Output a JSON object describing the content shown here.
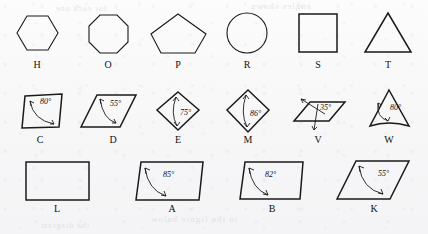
{
  "figure": {
    "background_color": "#f8f8f8",
    "ink_color": "#1a1a1a",
    "ghost_texts": [
      {
        "text": "in the figure below",
        "x": 150,
        "y": 222,
        "size": 9
      },
      {
        "text": "the diagram",
        "x": 40,
        "y": 228,
        "size": 8
      },
      {
        "text": "angles shown",
        "x": 260,
        "y": 8,
        "size": 9
      },
      {
        "text": "for each one",
        "x": 60,
        "y": 12,
        "size": 8
      }
    ],
    "rows": [
      {
        "row_id": "row-polygons",
        "label_y": 68,
        "items": [
          {
            "id": "H",
            "label": "H",
            "shape": "hexagon",
            "label_x": 37,
            "angle": null
          },
          {
            "id": "O",
            "label": "O",
            "shape": "octagon",
            "label_x": 108,
            "angle": null
          },
          {
            "id": "P",
            "label": "P",
            "shape": "pentagon",
            "label_x": 178,
            "angle": null
          },
          {
            "id": "R",
            "label": "R",
            "shape": "circle",
            "label_x": 247,
            "angle": null
          },
          {
            "id": "S",
            "label": "S",
            "shape": "square",
            "label_x": 318,
            "angle": null
          },
          {
            "id": "T",
            "label": "T",
            "shape": "triangle",
            "label_x": 388,
            "angle": null
          }
        ]
      },
      {
        "row_id": "row-angled-small",
        "label_y": 143,
        "items": [
          {
            "id": "C",
            "label": "C",
            "shape": "parallelogram-slanted",
            "label_x": 40,
            "angle": "80°"
          },
          {
            "id": "D",
            "label": "D",
            "shape": "rhombus-wide",
            "label_x": 113,
            "angle": "55°"
          },
          {
            "id": "E",
            "label": "E",
            "shape": "diamond",
            "label_x": 178,
            "angle": "75°"
          },
          {
            "id": "M",
            "label": "M",
            "shape": "diamond-tall",
            "label_x": 248,
            "angle": "86°"
          },
          {
            "id": "V",
            "label": "V",
            "shape": "parallelogram-flat",
            "label_x": 318,
            "angle": "35°"
          },
          {
            "id": "W",
            "label": "W",
            "shape": "trapezoid-curved",
            "label_x": 389,
            "angle": "80°"
          }
        ]
      },
      {
        "row_id": "row-quads",
        "label_y": 212,
        "items": [
          {
            "id": "L",
            "label": "L",
            "shape": "rectangle",
            "label_x": 57,
            "angle": null
          },
          {
            "id": "A",
            "label": "A",
            "shape": "parallelogram-right",
            "label_x": 172,
            "angle": "85°"
          },
          {
            "id": "B",
            "label": "B",
            "shape": "parallelogram-right2",
            "label_x": 272,
            "angle": "82°"
          },
          {
            "id": "K",
            "label": "K",
            "shape": "parallelogram-slant",
            "label_x": 374,
            "angle": "55°"
          }
        ]
      }
    ],
    "angle_labels": {
      "C": "80°",
      "D": "55°",
      "E": "75°",
      "M": "86°",
      "V": "35°",
      "W": "80°",
      "A": "85°",
      "B": "82°",
      "K": "55°"
    }
  }
}
